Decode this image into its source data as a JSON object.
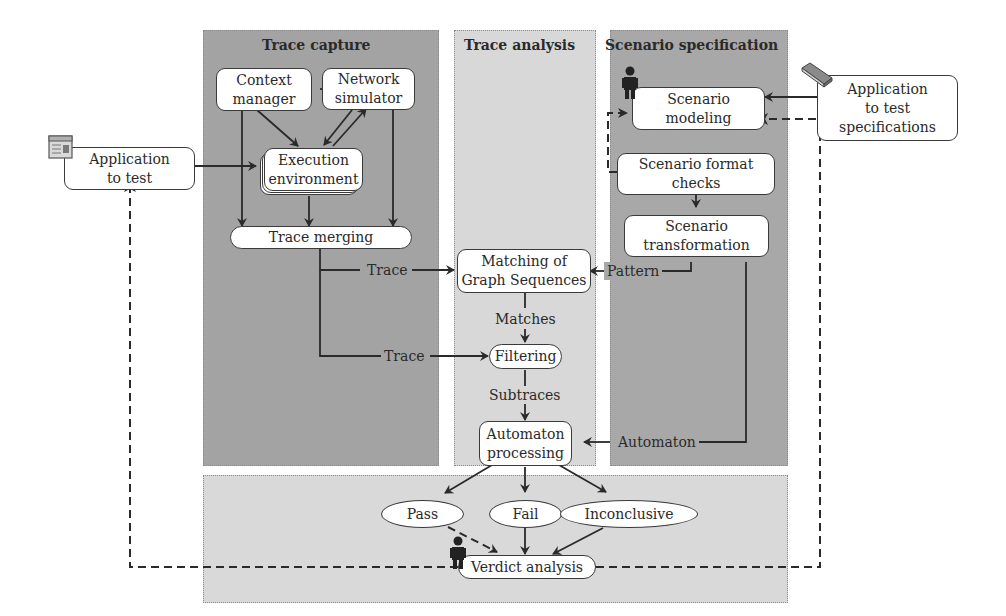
{
  "regions": {
    "trace_capture": {
      "title": "Trace capture",
      "color": "#a3a3a3"
    },
    "trace_analysis": {
      "title": "Trace analysis",
      "color": "#d8d8d8"
    },
    "scenario_specification": {
      "title": "Scenario specification",
      "color": "#a8a8a8"
    },
    "verdict_area": {
      "color": "#d9d9d9"
    }
  },
  "nodes": {
    "context_manager": "Context manager",
    "context_manager_lines": [
      "Context",
      "manager"
    ],
    "network_simulator_lines": [
      "Network",
      "simulator"
    ],
    "execution_environment_lines": [
      "Execution",
      "environment"
    ],
    "trace_merging": "Trace merging",
    "application_to_test_lines": [
      "Application",
      "to test"
    ],
    "app_specs_lines": [
      "Application",
      "to test",
      "specifications"
    ],
    "scenario_modeling_lines": [
      "Scenario",
      "modeling"
    ],
    "scenario_format_checks_lines": [
      "Scenario format",
      "checks"
    ],
    "scenario_transformation_lines": [
      "Scenario",
      "transformation"
    ],
    "matching_lines": [
      "Matching of",
      "Graph Sequences"
    ],
    "filtering": "Filtering",
    "automaton_processing_lines": [
      "Automaton",
      "processing"
    ],
    "pass": "Pass",
    "fail": "Fail",
    "inconclusive": "Inconclusive",
    "verdict_analysis": "Verdict analysis"
  },
  "edge_labels": {
    "trace_1": "Trace",
    "trace_2": "Trace",
    "pattern": "Pattern",
    "matches": "Matches",
    "subtraces": "Subtraces",
    "automaton": "Automaton"
  },
  "icons": {
    "application_icon": "window-document-icon",
    "specifications_icon": "book-icon",
    "modeler_person": "person-icon",
    "analyst_person": "person-icon"
  }
}
